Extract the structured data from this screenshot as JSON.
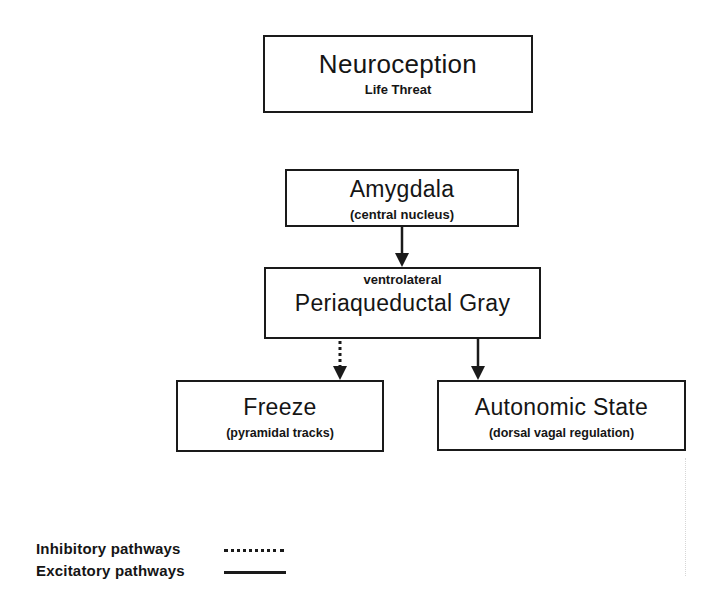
{
  "diagram": {
    "nodes": [
      {
        "id": "neuroception",
        "title": "Neuroception",
        "subtitle": "Life Threat"
      },
      {
        "id": "amygdala",
        "title": "Amygdala",
        "subtitle": "(central nucleus)"
      },
      {
        "id": "pag",
        "title": "Periaqueductal Gray",
        "subtitle": "ventrolateral"
      },
      {
        "id": "freeze",
        "title": "Freeze",
        "subtitle": "(pyramidal tracks)"
      },
      {
        "id": "autonomic",
        "title": "Autonomic State",
        "subtitle": "(dorsal vagal regulation)"
      }
    ],
    "edges": [
      {
        "from": "amygdala",
        "to": "pag",
        "type": "excitatory",
        "style": "solid"
      },
      {
        "from": "pag",
        "to": "freeze",
        "type": "inhibitory",
        "style": "dotted"
      },
      {
        "from": "pag",
        "to": "autonomic",
        "type": "excitatory",
        "style": "solid"
      }
    ],
    "legend": [
      {
        "label": "Inhibitory pathways",
        "style": "dotted"
      },
      {
        "label": "Excitatory pathways",
        "style": "solid"
      }
    ],
    "colors": {
      "stroke": "#1a1a1a",
      "background": "#ffffff",
      "text": "#151515"
    }
  }
}
